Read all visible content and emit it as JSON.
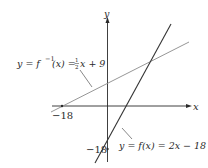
{
  "figure": {
    "axes": {
      "x_label": "x",
      "y_label": "y"
    },
    "ticks": {
      "x_tick_label": "−18",
      "y_tick_label": "−18"
    },
    "lines": [
      {
        "name": "f",
        "label_lhs": "y = f(x) = 2x − 18",
        "equation": "y = 2x - 18",
        "color": "#333333"
      },
      {
        "name": "f_inverse",
        "label_lhs": "y = f⁻¹(x) = ½x + 9",
        "equation": "y = (1/2)x + 9",
        "color": "#888888"
      }
    ],
    "colors": {
      "axis": "#2a2a2a",
      "background": "#ffffff"
    }
  },
  "labels": {
    "finv_prefix": "y = f",
    "finv_sup": "−1",
    "finv_mid": "(x) = ",
    "finv_num": "1",
    "finv_den": "2",
    "finv_suffix": "x + 9",
    "f_text": "y = f(x) = 2x − 18",
    "x_tick": "−18",
    "y_tick": "−18",
    "x_axis": "x",
    "y_axis": "y"
  }
}
